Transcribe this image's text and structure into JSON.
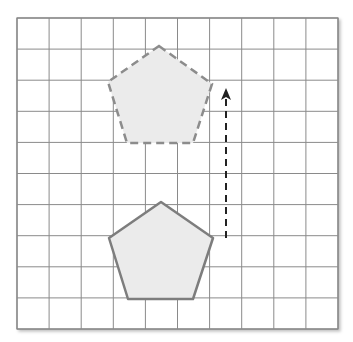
{
  "diagram": {
    "type": "translation-on-grid",
    "grid": {
      "columns": 10,
      "rows": 10,
      "left": 17,
      "top": 18,
      "right": 338,
      "bottom": 329,
      "line_color": "#8a8a8a",
      "background": "#ffffff"
    },
    "image_shape": {
      "name": "pentagon",
      "style": "dashed",
      "points": [
        [
          159,
          46
        ],
        [
          212,
          84
        ],
        [
          193,
          143
        ],
        [
          127,
          143
        ],
        [
          108,
          82
        ]
      ],
      "stroke": "#8c8c8c",
      "fill": "#ebebeb"
    },
    "original_shape": {
      "name": "pentagon",
      "style": "solid",
      "points": [
        [
          161,
          202
        ],
        [
          213,
          238
        ],
        [
          193,
          299
        ],
        [
          128,
          299
        ],
        [
          109,
          238
        ]
      ],
      "stroke": "#7d7d7d",
      "fill": "#ebebeb"
    },
    "translation_arrow": {
      "style": "dashed",
      "direction": "up",
      "from": [
        226,
        238
      ],
      "to": [
        226,
        88
      ],
      "color": "#222222"
    }
  }
}
